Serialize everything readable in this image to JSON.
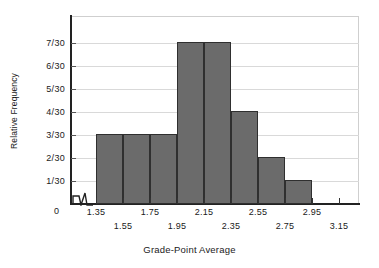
{
  "chart_data": {
    "type": "bar",
    "title": "",
    "xlabel": "Grade-Point Average",
    "ylabel": "Relative Frequency",
    "grid": true,
    "legend": null,
    "x_axis_break": true,
    "bin_edges": [
      1.35,
      1.55,
      1.75,
      1.95,
      2.15,
      2.35,
      2.55,
      2.75,
      2.95
    ],
    "categories": [
      "1.35-1.55",
      "1.55-1.75",
      "1.75-1.95",
      "1.95-2.15",
      "2.15-2.35",
      "2.35-2.55",
      "2.55-2.75",
      "2.75-2.95"
    ],
    "values": [
      3,
      3,
      3,
      7,
      7,
      4,
      2,
      1
    ],
    "value_labels": [
      "3/30",
      "3/30",
      "3/30",
      "7/30",
      "7/30",
      "4/30",
      "2/30",
      "1/30"
    ],
    "ylim": [
      0,
      7
    ],
    "ytick_values": [
      1,
      2,
      3,
      4,
      5,
      6,
      7
    ],
    "ytick_labels": [
      "1/30",
      "2/30",
      "3/30",
      "4/30",
      "5/30",
      "6/30",
      "7/30"
    ],
    "y_origin_label": "0",
    "xtick_labels_upper": [
      "1.35",
      "1.75",
      "2.15",
      "2.55",
      "2.95"
    ],
    "xtick_labels_lower": [
      "1.55",
      "1.95",
      "2.35",
      "2.75",
      "3.15"
    ],
    "xtick_labels_all": [
      "1.35",
      "1.55",
      "1.75",
      "1.95",
      "2.15",
      "2.35",
      "2.55",
      "2.75",
      "2.95",
      "3.15"
    ],
    "xlim": [
      1.35,
      3.15
    ],
    "colors": {
      "bar_fill": "#6b6b6b",
      "bar_edge": "#2f2f2f",
      "axis": "#222222",
      "gridline": "#d9d9d9",
      "background": "#ffffff",
      "text": "#1a1a1a"
    }
  }
}
